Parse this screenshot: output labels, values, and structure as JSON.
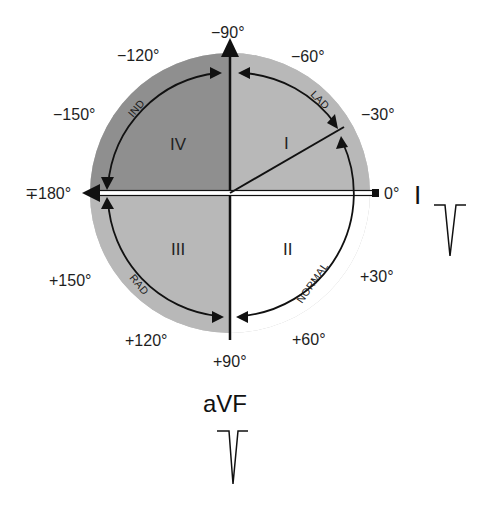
{
  "diagram": {
    "type": "hexaxial-reference-axis",
    "colors": {
      "outer_ring": "#bdbdbd",
      "quadrant_IV": "#8f8f8f",
      "quadrant_I": "#b4b4b4",
      "quadrant_III": "#b4b4b4",
      "quadrant_II": "#ffffff",
      "lines": "#111111"
    },
    "angle_labels": {
      "neg90": "−90°",
      "neg60": "−60°",
      "neg30": "−30°",
      "zero": "0°",
      "pos30": "+30°",
      "pos60": "+60°",
      "pos90": "+90°",
      "pos120": "+120°",
      "pos150": "+150°",
      "pm180": "∓180°",
      "neg150": "−150°",
      "neg120": "−120°"
    },
    "quadrants": {
      "I": "I",
      "II": "II",
      "III": "III",
      "IV": "IV"
    },
    "arc_labels": {
      "lad": "LAD",
      "normal": "NORMAL",
      "rad": "RAD",
      "ind": "IND"
    },
    "leads": {
      "lead_I": {
        "label": "I",
        "complex": "negative-deflection"
      },
      "lead_aVF": {
        "label": "aVF",
        "complex": "negative-deflection"
      }
    }
  }
}
